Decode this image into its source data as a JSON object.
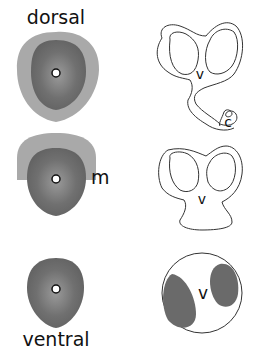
{
  "labels": {
    "top": "dorsal",
    "bottom": "ventral",
    "marker_o1": "o",
    "marker_o2": "o",
    "marker_o3": "o",
    "marker_m": "m",
    "v1": "v",
    "v2": "v",
    "v3": "v",
    "c": "c"
  },
  "colors": {
    "outer_gray": "#a8a8a8",
    "inner_gray": "#6e6e6e",
    "line": "#333333",
    "background": "#ffffff"
  }
}
